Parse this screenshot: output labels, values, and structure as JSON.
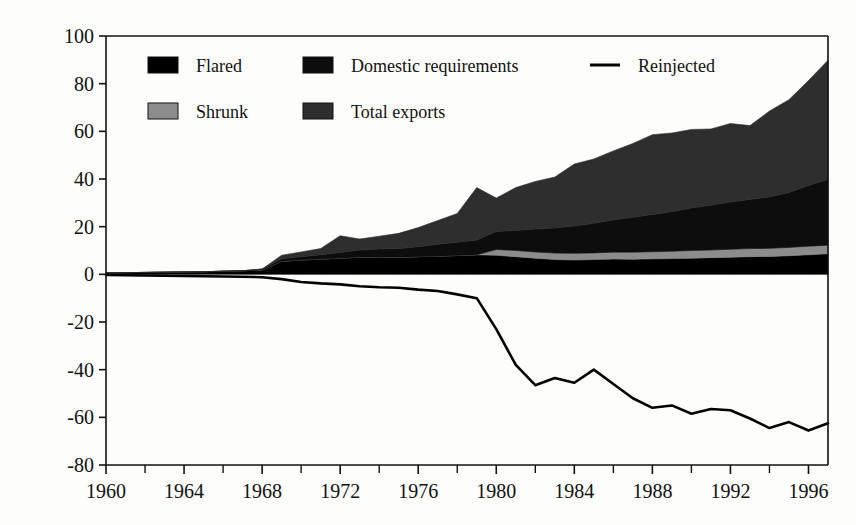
{
  "chart_data": {
    "type": "area",
    "title": "",
    "xlabel": "",
    "ylabel": "billion cubic metres",
    "xlim": [
      1960,
      1997
    ],
    "ylim": [
      -80,
      100
    ],
    "ytick_values": [
      100,
      80,
      60,
      40,
      20,
      0,
      -20,
      -40,
      -60,
      -80
    ],
    "ytick_labels": [
      "100",
      "80",
      "60",
      "40",
      "20",
      "0",
      "-20",
      "-40",
      "-60",
      "-80"
    ],
    "xtick_values": [
      1960,
      1964,
      1968,
      1972,
      1976,
      1980,
      1984,
      1988,
      1992,
      1996
    ],
    "xtick_labels": [
      "1960",
      "1964",
      "1968",
      "1972",
      "1976",
      "1980",
      "1984",
      "1988",
      "1992",
      "1996"
    ],
    "xtick_minor_values": [
      1962,
      1966,
      1970,
      1974,
      1978,
      1982,
      1986,
      1990,
      1994
    ],
    "grid": false,
    "legend_position": "inside-top-left",
    "stacking": "stacked-positive",
    "x": [
      1960,
      1961,
      1962,
      1963,
      1964,
      1965,
      1966,
      1967,
      1968,
      1969,
      1970,
      1971,
      1972,
      1973,
      1974,
      1975,
      1976,
      1977,
      1978,
      1979,
      1980,
      1981,
      1982,
      1983,
      1984,
      1985,
      1986,
      1987,
      1988,
      1989,
      1990,
      1991,
      1992,
      1993,
      1994,
      1995,
      1996,
      1997
    ],
    "series": [
      {
        "name": "Flared",
        "color": "#000000",
        "kind": "area",
        "stack_order": 1,
        "values": [
          0.6,
          0.7,
          0.8,
          0.9,
          1.0,
          1.1,
          1.3,
          1.5,
          1.8,
          5.5,
          6.0,
          6.4,
          6.8,
          7.2,
          7.3,
          7.2,
          7.4,
          7.6,
          7.9,
          8.2,
          8.0,
          7.4,
          6.8,
          6.2,
          6.0,
          6.2,
          6.4,
          6.3,
          6.5,
          6.6,
          6.8,
          7.0,
          7.2,
          7.4,
          7.5,
          7.8,
          8.2,
          8.6
        ]
      },
      {
        "name": "Shrunk",
        "color": "#8c8c8c",
        "kind": "area",
        "stack_order": 2,
        "values": [
          0,
          0,
          0,
          0,
          0,
          0,
          0,
          0,
          0,
          0,
          0,
          0,
          0,
          0,
          0,
          0,
          0,
          0,
          0,
          0,
          2.4,
          2.6,
          2.6,
          2.7,
          2.8,
          2.8,
          2.9,
          3.0,
          3.0,
          3.1,
          3.2,
          3.2,
          3.3,
          3.4,
          3.4,
          3.5,
          3.6,
          3.6
        ]
      },
      {
        "name": "Domestic requirements",
        "color": "#0d0d0d",
        "kind": "area",
        "stack_order": 3,
        "values": [
          0,
          0,
          0,
          0,
          0,
          0,
          0,
          0,
          0.4,
          1.0,
          1.4,
          1.8,
          2.4,
          3.0,
          3.3,
          3.6,
          4.2,
          5.0,
          5.6,
          6.2,
          7.6,
          8.4,
          9.6,
          10.5,
          11.5,
          12.4,
          13.5,
          14.6,
          15.6,
          16.6,
          17.8,
          18.8,
          19.8,
          20.6,
          21.6,
          23.0,
          25.5,
          27.6
        ]
      },
      {
        "name": "Total exports",
        "color": "#2e2e2e",
        "kind": "area",
        "stack_order": 4,
        "values": [
          0,
          0,
          0,
          0,
          0,
          0,
          0,
          0,
          0,
          1.5,
          2.0,
          2.6,
          7.0,
          4.6,
          5.4,
          6.4,
          8.0,
          10.0,
          12.0,
          22.0,
          14.0,
          18.0,
          20.0,
          21.4,
          26.0,
          27.0,
          29.0,
          31.0,
          33.5,
          33.0,
          33.0,
          32.0,
          33.0,
          31.0,
          36.0,
          39.0,
          44.0,
          50.0
        ]
      },
      {
        "name": "Reinjected",
        "color": "#000000",
        "kind": "line",
        "values": [
          -0.3,
          -0.4,
          -0.5,
          -0.6,
          -0.7,
          -0.8,
          -0.9,
          -1.0,
          -1.2,
          -2.0,
          -3.2,
          -3.8,
          -4.2,
          -5.0,
          -5.4,
          -5.6,
          -6.4,
          -7.0,
          -8.4,
          -10.0,
          -23.0,
          -38.0,
          -46.5,
          -43.5,
          -45.5,
          -40.0,
          -46.0,
          -52.0,
          -56.0,
          -55.0,
          -58.5,
          -56.5,
          -57.0,
          -60.5,
          -64.5,
          -62.0,
          -65.5,
          -62.5
        ]
      }
    ]
  },
  "legend": {
    "items": [
      {
        "label": "Flared",
        "marker": "swatch",
        "color": "#000000"
      },
      {
        "label": "Domestic requirements",
        "marker": "swatch",
        "color": "#0d0d0d"
      },
      {
        "label": "Reinjected",
        "marker": "line",
        "color": "#000000"
      },
      {
        "label": "Shrunk",
        "marker": "swatch",
        "color": "#8c8c8c"
      },
      {
        "label": "Total exports",
        "marker": "swatch",
        "color": "#2e2e2e"
      }
    ]
  },
  "axis": {
    "y_title": "billion cubic metres"
  }
}
